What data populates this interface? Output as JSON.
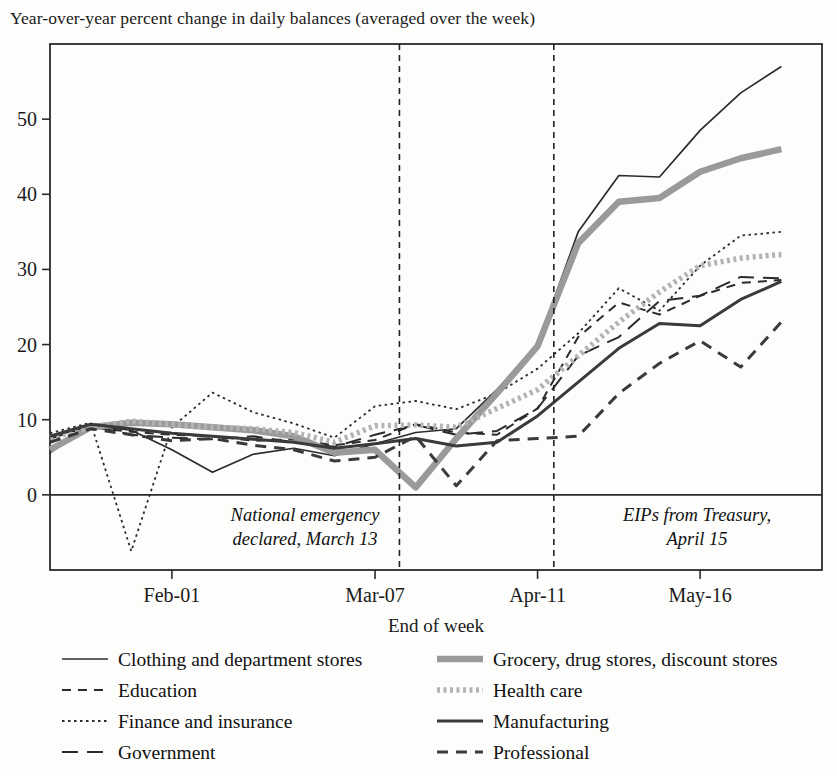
{
  "chart_data": {
    "type": "line",
    "title": "Year-over-year percent change in daily balances (averaged over the week)",
    "xlabel": "End of week",
    "ylabel": "",
    "xlim": [
      0,
      19
    ],
    "ylim": [
      -10,
      60
    ],
    "yticks": [
      0,
      10,
      20,
      30,
      40,
      50
    ],
    "yticklabels": [
      "0",
      "10",
      "20",
      "30",
      "40",
      "50"
    ],
    "xticks": [
      3,
      8,
      12,
      16
    ],
    "xticklabels": [
      "Feb-01",
      "Mar-07",
      "Apr-11",
      "May-16"
    ],
    "grid": false,
    "legend_position": "below-plot",
    "zero_line": true,
    "x": [
      0,
      1,
      2,
      3,
      4,
      5,
      6,
      7,
      8,
      9,
      10,
      11,
      12,
      13,
      14,
      15,
      16,
      17,
      18
    ],
    "annotations": [
      {
        "name": "national-emergency",
        "text_line1": "National emergency",
        "text_line2": "declared, March 13",
        "x": 8.6
      },
      {
        "name": "eips-treasury",
        "text_line1": "EIPs from Treasury,",
        "text_line2": "April 15",
        "x": 12.4
      }
    ],
    "event_lines": [
      {
        "name": "march-13-line",
        "x": 8.6,
        "label": "National emergency declared, March 13"
      },
      {
        "name": "april-15-line",
        "x": 12.4,
        "label": "EIPs from Treasury, April 15"
      }
    ],
    "series": [
      {
        "name": "Clothing and department stores",
        "style": "solid-thin",
        "color": "#2b2b2b",
        "width": 1.7,
        "values": [
          5.6,
          9.2,
          8.6,
          6.0,
          3.0,
          5.4,
          6.2,
          5.2,
          6.8,
          8.3,
          8.8,
          14.0,
          20.0,
          35.0,
          42.5,
          42.3,
          48.5,
          53.5,
          57.0
        ]
      },
      {
        "name": "Education",
        "style": "dashed-med",
        "color": "#2b2b2b",
        "width": 2.0,
        "values": [
          7.8,
          9.0,
          8.4,
          8.0,
          7.8,
          7.2,
          7.4,
          6.6,
          7.3,
          9.4,
          8.3,
          8.0,
          11.5,
          21.0,
          25.6,
          24.0,
          26.5,
          28.2,
          28.6
        ]
      },
      {
        "name": "Finance and insurance",
        "style": "dotted-fine",
        "color": "#2b2b2b",
        "width": 1.8,
        "values": [
          8.2,
          9.6,
          -7.5,
          9.0,
          13.6,
          11.0,
          9.5,
          7.6,
          11.8,
          12.5,
          11.4,
          13.5,
          16.8,
          21.5,
          27.5,
          24.5,
          30.5,
          34.5,
          35.0
        ]
      },
      {
        "name": "Government",
        "style": "dashed-long",
        "color": "#2b2b2b",
        "width": 2.0,
        "values": [
          7.5,
          9.2,
          8.0,
          7.6,
          7.4,
          7.8,
          7.0,
          6.4,
          8.0,
          9.3,
          8.0,
          8.5,
          11.5,
          18.5,
          21.0,
          25.8,
          26.5,
          29.0,
          28.8
        ]
      },
      {
        "name": "Grocery, drug stores, discount stores",
        "style": "thick-grey",
        "color": "#9a9a9a",
        "width": 6.5,
        "values": [
          6.0,
          9.0,
          9.6,
          9.4,
          9.0,
          8.6,
          7.8,
          5.6,
          6.0,
          1.0,
          7.5,
          13.5,
          19.8,
          33.5,
          39.0,
          39.5,
          43.0,
          44.8,
          46.0
        ]
      },
      {
        "name": "Health care",
        "style": "dotted-thick-grey",
        "color": "#b3b3b3",
        "width": 5.5,
        "values": [
          7.6,
          9.0,
          9.8,
          9.4,
          9.0,
          8.8,
          8.3,
          7.0,
          9.2,
          9.3,
          9.0,
          11.5,
          14.0,
          18.5,
          23.0,
          27.0,
          30.5,
          31.5,
          32.0
        ]
      },
      {
        "name": "Manufacturing",
        "style": "solid-thick",
        "color": "#3a3a3a",
        "width": 3.0,
        "values": [
          7.8,
          9.4,
          8.8,
          8.2,
          7.8,
          7.4,
          7.0,
          6.2,
          6.8,
          7.5,
          6.5,
          7.0,
          10.5,
          15.0,
          19.5,
          22.8,
          22.5,
          26.0,
          28.4
        ]
      },
      {
        "name": "Professional",
        "style": "dashed-short",
        "color": "#3a3a3a",
        "width": 3.0,
        "values": [
          7.0,
          8.8,
          8.0,
          7.2,
          7.5,
          6.6,
          6.0,
          4.5,
          5.0,
          7.8,
          1.2,
          7.2,
          7.5,
          7.8,
          13.5,
          17.5,
          20.5,
          17.0,
          23.0
        ]
      }
    ]
  },
  "legend": {
    "left_column": [
      {
        "label": "Clothing and department stores",
        "style": "solid-thin"
      },
      {
        "label": "Education",
        "style": "dashed-med"
      },
      {
        "label": "Finance and insurance",
        "style": "dotted-fine"
      },
      {
        "label": "Government",
        "style": "dashed-long"
      }
    ],
    "right_column": [
      {
        "label": "Grocery, drug stores, discount stores",
        "style": "thick-grey"
      },
      {
        "label": "Health care",
        "style": "dotted-thick-grey"
      },
      {
        "label": "Manufacturing",
        "style": "solid-thick"
      },
      {
        "label": "Professional",
        "style": "dashed-short"
      }
    ]
  }
}
